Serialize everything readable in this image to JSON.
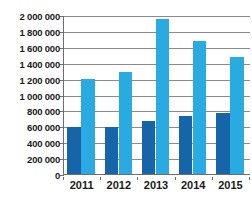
{
  "chart_data": {
    "type": "bar",
    "title": "",
    "subtitle": "",
    "xlabel": "",
    "ylabel": "",
    "categories": [
      "2011",
      "2012",
      "2013",
      "2014",
      "2015"
    ],
    "series": [
      {
        "name": "Series 1",
        "color": "#1565A8",
        "values": [
          605000,
          602000,
          685000,
          742000,
          782000
        ]
      },
      {
        "name": "Series 2",
        "color": "#29ABE2",
        "values": [
          1205000,
          1292000,
          1962000,
          1690000,
          1487000
        ]
      }
    ],
    "ylim": [
      0,
      2000000
    ],
    "ytick_step": 200000,
    "ytick_values": [
      2000000,
      1800000,
      1600000,
      1400000,
      1200000,
      1000000,
      800000,
      600000,
      400000,
      200000,
      0
    ],
    "ytick_labels": [
      "2 000 000",
      "1 800 000",
      "1 600 000",
      "1 400 000",
      "1 200 000",
      "1 000 000",
      "800 000",
      "600 000",
      "400 000",
      "200 000",
      "0"
    ],
    "grid": true,
    "grid_axis": "y",
    "grid_color": "#8A8A8A",
    "axis_color": "#6E6E6E",
    "legend": false,
    "legend_position": "none",
    "background": "#FFFFFF",
    "annotations": []
  }
}
